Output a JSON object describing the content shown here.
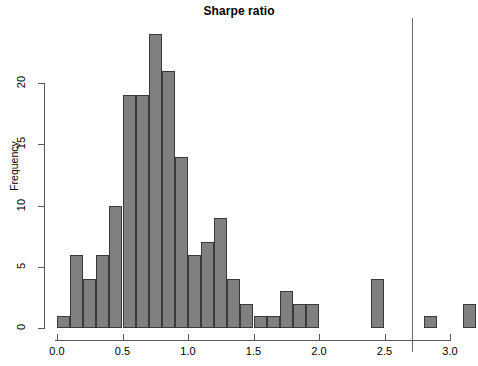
{
  "chart_data": {
    "type": "bar",
    "title": "Sharpe ratio",
    "xlabel": "",
    "ylabel": "Frequency",
    "xlim": [
      0.0,
      3.2
    ],
    "ylim": [
      0,
      24
    ],
    "grid": false,
    "legend": null,
    "bin_width": 0.1,
    "x_ticks": [
      "0.0",
      "0.5",
      "1.0",
      "1.5",
      "2.0",
      "2.5",
      "3.0"
    ],
    "x_tick_values": [
      0.0,
      0.5,
      1.0,
      1.5,
      2.0,
      2.5,
      3.0
    ],
    "y_ticks": [
      "0",
      "5",
      "10",
      "15",
      "20"
    ],
    "y_tick_values": [
      0,
      5,
      10,
      15,
      20
    ],
    "bin_starts": [
      0.0,
      0.1,
      0.2,
      0.3,
      0.4,
      0.5,
      0.6,
      0.7,
      0.8,
      0.9,
      1.0,
      1.1,
      1.2,
      1.3,
      1.4,
      1.5,
      1.6,
      1.7,
      1.8,
      1.9,
      2.0,
      2.1,
      2.2,
      2.3,
      2.4,
      2.5,
      2.6,
      2.7,
      2.8,
      2.9,
      3.0,
      3.1
    ],
    "categories": [
      "0.0-0.1",
      "0.1-0.2",
      "0.2-0.3",
      "0.3-0.4",
      "0.4-0.5",
      "0.5-0.6",
      "0.6-0.7",
      "0.7-0.8",
      "0.8-0.9",
      "0.9-1.0",
      "1.0-1.1",
      "1.1-1.2",
      "1.2-1.3",
      "1.3-1.4",
      "1.4-1.5",
      "1.5-1.6",
      "1.6-1.7",
      "1.7-1.8",
      "1.8-1.9",
      "1.9-2.0",
      "2.0-2.1",
      "2.1-2.2",
      "2.2-2.3",
      "2.3-2.4",
      "2.4-2.5",
      "2.5-2.6",
      "2.6-2.7",
      "2.7-2.8",
      "2.8-2.9",
      "2.9-3.0",
      "3.0-3.1",
      "3.1-3.2"
    ],
    "values": [
      1,
      6,
      4,
      6,
      10,
      19,
      19,
      24,
      21,
      14,
      6,
      7,
      9,
      4,
      2,
      1,
      1,
      3,
      2,
      2,
      0,
      0,
      0,
      0,
      4,
      0,
      0,
      0,
      1,
      0,
      0,
      2
    ],
    "annotations": [
      {
        "name": "vertical-reference-line",
        "type": "vline",
        "x": 2.71
      }
    ],
    "colors": {
      "bar_fill": "#808080",
      "bar_border": "#3a3a3a",
      "axis": "#5a5a5a",
      "reference_line": "#6a6a6a",
      "text": "#000000",
      "background": "#ffffff"
    }
  }
}
